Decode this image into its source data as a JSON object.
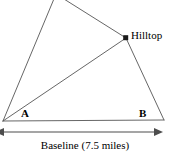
{
  "figure": {
    "kind": "geometry-diagram",
    "width": 170,
    "height": 162,
    "background_color": "#ffffff",
    "line_color": "#555555",
    "text_color": "#000000",
    "arrow_color": "#4d4d4d",
    "point_marker_color": "#1a1a1a"
  },
  "labels": {
    "vertex_a": "A",
    "vertex_b": "B",
    "hilltop": "Hilltop",
    "baseline_caption": "Baseline (7.5 miles)"
  },
  "measurements": {
    "baseline_length": "7.5",
    "baseline_unit": "miles"
  },
  "geometry": {
    "apex": {
      "x": 56,
      "y": -6
    },
    "vertex_a": {
      "x": 3,
      "y": 121
    },
    "vertex_right": {
      "x": 164,
      "y": 120
    },
    "hilltop_point": {
      "x": 126,
      "y": 38
    },
    "sight_line_from_a": {
      "x1": 3,
      "y1": 121,
      "x2": 126,
      "y2": 38
    },
    "arrow": {
      "x1": 3,
      "y1": 132,
      "x2": 155,
      "y2": 132
    }
  }
}
